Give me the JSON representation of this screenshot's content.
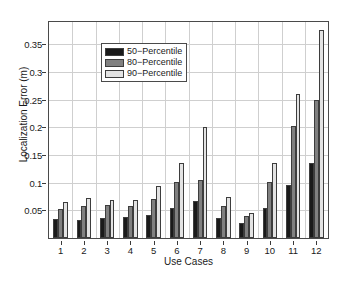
{
  "chart_data": {
    "type": "bar",
    "title": "",
    "xlabel": "Use Cases",
    "ylabel": "Localization Error (m)",
    "categories": [
      "1",
      "2",
      "3",
      "4",
      "5",
      "6",
      "7",
      "8",
      "9",
      "10",
      "11",
      "12"
    ],
    "ylim": [
      0,
      0.39
    ],
    "ytick_values": [
      0.05,
      0.1,
      0.15,
      0.2,
      0.25,
      0.3,
      0.35
    ],
    "ytick_labels": [
      "0.05",
      "0.1",
      "0.15",
      "0.2",
      "0.25",
      "0.3",
      "0.35"
    ],
    "grid": true,
    "legend_position": "upper left",
    "series": [
      {
        "name": "50−Percentile",
        "color": "#1a1a1a",
        "values": [
          0.035,
          0.032,
          0.036,
          0.038,
          0.041,
          0.054,
          0.066,
          0.036,
          0.028,
          0.055,
          0.095,
          0.136
        ]
      },
      {
        "name": "80−Percentile",
        "color": "#808080",
        "values": [
          0.053,
          0.057,
          0.059,
          0.057,
          0.07,
          0.102,
          0.105,
          0.057,
          0.04,
          0.102,
          0.202,
          0.249
        ]
      },
      {
        "name": "90−Percentile",
        "color": "#e3e3e3",
        "values": [
          0.065,
          0.073,
          0.068,
          0.068,
          0.094,
          0.136,
          0.201,
          0.074,
          0.046,
          0.136,
          0.26,
          0.376
        ]
      }
    ]
  },
  "legend": {
    "items": [
      {
        "label": "50−Percentile",
        "swatch": "#1a1a1a"
      },
      {
        "label": "80−Percentile",
        "swatch": "#808080"
      },
      {
        "label": "90−Percentile",
        "swatch": "#e3e3e3"
      }
    ]
  },
  "axes": {
    "y_title": "Localization Error (m)",
    "x_title": "Use Cases"
  }
}
